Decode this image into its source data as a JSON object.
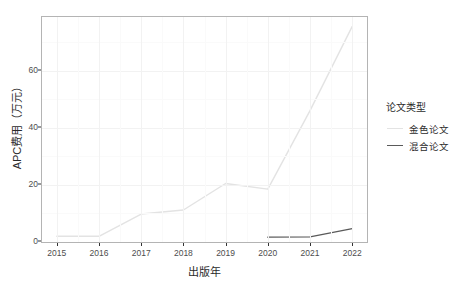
{
  "chart_data": {
    "type": "line",
    "title": "",
    "xlabel": "出版年",
    "ylabel": "APC费用（万元）",
    "x": [
      2015,
      2016,
      2017,
      2018,
      2019,
      2020,
      2021,
      2022
    ],
    "categories": [
      "2015",
      "2016",
      "2017",
      "2018",
      "2019",
      "2020",
      "2021",
      "2022"
    ],
    "series": [
      {
        "name": "金色论文",
        "color": "#e3e3e3",
        "values": [
          2.0,
          2.0,
          9.8,
          11.2,
          20.5,
          18.5,
          46.0,
          75.5
        ]
      },
      {
        "name": "混合论文",
        "color": "#5a5a5a",
        "values": [
          null,
          null,
          null,
          null,
          null,
          1.7,
          1.8,
          4.7
        ]
      }
    ],
    "xlim": [
      2014.65,
      2022.35
    ],
    "ylim": [
      0,
      78.8
    ],
    "yticks": [
      0,
      20,
      40,
      60
    ],
    "ytick_labels": [
      "0",
      "20",
      "40",
      "60"
    ],
    "xticks": [
      2015,
      2016,
      2017,
      2018,
      2019,
      2020,
      2021,
      2022
    ],
    "grid": true,
    "legend_position": "right",
    "legend_title": "论文类型"
  },
  "legend": {
    "title": "论文类型",
    "items": [
      {
        "label": "金色论文",
        "color": "#e3e3e3"
      },
      {
        "label": "混合论文",
        "color": "#5a5a5a"
      }
    ]
  },
  "axes": {
    "y_title": "APC费用（万元）",
    "x_title": "出版年"
  }
}
